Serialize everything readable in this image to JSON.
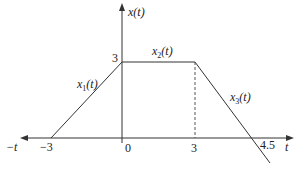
{
  "diagram": {
    "type": "piecewise-signal-plot",
    "y_axis_label": "x(t)",
    "x_axis_label_right": "t",
    "x_axis_label_left": "−t",
    "x_ticks": [
      {
        "label": "−3",
        "value": -3
      },
      {
        "label": "0",
        "value": 0
      },
      {
        "label": "3",
        "value": 3
      },
      {
        "label": "4.5",
        "value": 4.5
      }
    ],
    "y_ticks": [
      {
        "label": "3",
        "value": 3
      }
    ],
    "segments": [
      {
        "name": "x1(t)",
        "label_main": "x",
        "label_sub": "1",
        "label_tail": "(t)",
        "from": [
          -3,
          0
        ],
        "to": [
          0,
          3
        ]
      },
      {
        "name": "x2(t)",
        "label_main": "x",
        "label_sub": "2",
        "label_tail": "(t)",
        "from": [
          0,
          3
        ],
        "to": [
          3,
          3
        ]
      },
      {
        "name": "x3(t)",
        "label_main": "x",
        "label_sub": "3",
        "label_tail": "(t)",
        "from": [
          3,
          3
        ],
        "to": [
          4.5,
          0
        ]
      }
    ],
    "dashed_guide": {
      "at_t": 3,
      "from_y": 3,
      "to_y": 0
    }
  }
}
